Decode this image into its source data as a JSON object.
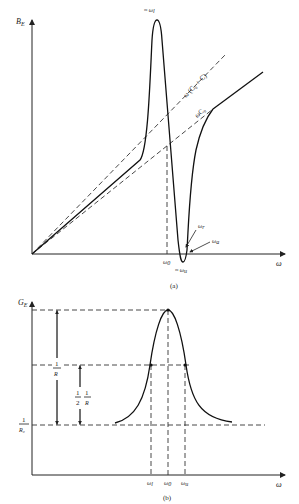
{
  "diagram_a": {
    "y_axis_label": "B",
    "y_axis_sub": "E",
    "x_axis_label": "ω",
    "peak_label": "≈ ω",
    "peak_sub": "l",
    "line1_label": "ω (C₀ + C)",
    "line2_label": "ωC₀",
    "omega_r_label": "ω",
    "omega_r_sub": "r",
    "omega_a_label": "ω",
    "omega_a_sub": "a",
    "omega0_label": "ω",
    "omega0_sub": "0",
    "trough_label": "≈ ω",
    "trough_sub": "u",
    "caption": "(a)"
  },
  "diagram_b": {
    "y_axis_label": "G",
    "y_axis_sub": "E",
    "x_axis_label": "ω",
    "one_over_R_num": "1",
    "one_over_R_den": "R",
    "half_num": "1",
    "half_den": "2",
    "half_R_num": "1",
    "half_R_den": "R",
    "one_over_R0_num": "1",
    "one_over_R0_den": "R₀",
    "omega_l_label": "ω",
    "omega_l_sub": "l",
    "omega0_label": "ω",
    "omega0_sub": "0",
    "omega_u_label": "ω",
    "omega_u_sub": "u",
    "caption": "(b)"
  }
}
